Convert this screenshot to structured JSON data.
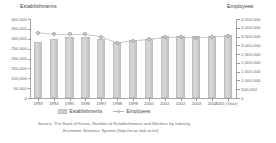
{
  "axis_titles": {
    "left": "Establishments",
    "right": "Employees"
  },
  "legend": {
    "items": [
      {
        "label": "Establishments",
        "type": "bar",
        "color": "#cfcfcf"
      },
      {
        "label": "Employees",
        "type": "line-marker",
        "color": "#b5b5b5"
      }
    ]
  },
  "source": {
    "line1": "Source: The Bank of Korea, Number of Establishments and Workers by industry,",
    "line2": "Economic Statistics System (http://ecos.bok.or.kr/)"
  },
  "xaxis_note": "(Year)",
  "chart_data": {
    "type": "bar",
    "title": "",
    "subtitle": "",
    "xlabel": "(Year)",
    "ylabel": "Establishments",
    "y2label": "Employees",
    "grid": false,
    "legend_position": "bottom",
    "categories": [
      "1993",
      "1994",
      "1995",
      "1996",
      "1997",
      "1998",
      "1999",
      "2000",
      "2001",
      "2002",
      "2003",
      "2004",
      "2005"
    ],
    "ylim": [
      0,
      400000
    ],
    "yticks": [
      0,
      50000,
      100000,
      150000,
      200000,
      250000,
      300000,
      350000,
      400000
    ],
    "ytick_labels": [
      "0",
      "50,000",
      "100,000",
      "150,000",
      "200,000",
      "250,000",
      "300,000",
      "350,000",
      "400,000"
    ],
    "y2lim": [
      0,
      4500000
    ],
    "y2ticks": [
      0,
      500000,
      1000000,
      1500000,
      2000000,
      2500000,
      3000000,
      3500000,
      4000000,
      4500000
    ],
    "y2tick_labels": [
      "0",
      "500,000",
      "1,000,000",
      "1,500,000",
      "2,000,000",
      "2,500,000",
      "3,000,000",
      "3,500,000",
      "4,000,000",
      "4,500,000"
    ],
    "series": [
      {
        "name": "Establishments",
        "axis": "left",
        "kind": "bar",
        "values": [
          283000,
          298000,
          308000,
          308000,
          300000,
          286000,
          293000,
          300000,
          312000,
          314000,
          315000,
          315000,
          318000
        ]
      },
      {
        "name": "Employees",
        "axis": "right",
        "kind": "line",
        "values": [
          3720000,
          3630000,
          3620000,
          3620000,
          3480000,
          3130000,
          3250000,
          3340000,
          3450000,
          3450000,
          3430000,
          3470000,
          3530000
        ]
      }
    ]
  }
}
